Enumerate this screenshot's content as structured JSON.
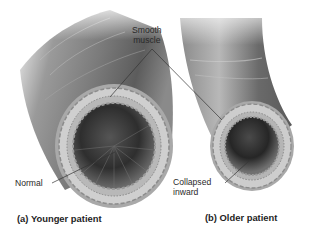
{
  "figure": {
    "labels": {
      "smooth_muscle_line1": "Smooth",
      "smooth_muscle_line2": "muscle",
      "normal": "Normal",
      "collapsed_line1": "Collapsed",
      "collapsed_line2": "inward"
    },
    "captions": {
      "a": "(a) Younger patient",
      "b": "(b) Older patient"
    },
    "colors": {
      "background": "#ffffff",
      "tube_dark": "#6e6e6e",
      "tube_light": "#d8d8d8",
      "wall": "#b4b4b4",
      "lumen_dark": "#3a3a3a",
      "leader_line": "#333333",
      "text": "#2a2a2a"
    }
  }
}
